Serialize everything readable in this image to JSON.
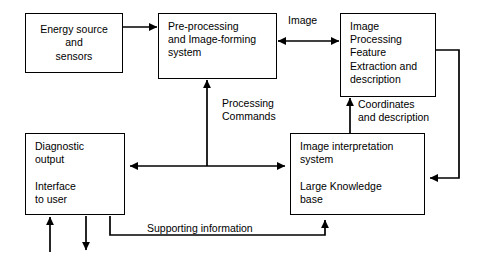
{
  "diagram": {
    "stroke_color": "#000000",
    "background_color": "#ffffff",
    "nodes": [
      {
        "id": "energy-source",
        "label": "Energy source\nand\nsensors",
        "x": 25,
        "y": 13,
        "w": 98,
        "h": 60,
        "align": "center"
      },
      {
        "id": "pre-processing",
        "label": "Pre-processing\nand Image-forming\nsystem",
        "x": 158,
        "y": 13,
        "w": 119,
        "h": 66,
        "align": "left"
      },
      {
        "id": "image-processing",
        "label": "Image\nProcessing\nFeature\nExtraction and\ndescription",
        "x": 340,
        "y": 13,
        "w": 96,
        "h": 84,
        "align": "left"
      },
      {
        "id": "diagnostic-output",
        "label": "Diagnostic\noutput\n\nInterface\nto user",
        "x": 25,
        "y": 133,
        "w": 100,
        "h": 82,
        "align": "left"
      },
      {
        "id": "image-interpretation",
        "label": "Image interpretation\nsystem\n\nLarge Knowledge\nbase",
        "x": 290,
        "y": 133,
        "w": 135,
        "h": 82,
        "align": "left"
      }
    ],
    "edge_labels": [
      {
        "id": "image",
        "text": "Image",
        "x": 288,
        "y": 14
      },
      {
        "id": "processing-commands",
        "text": "Processing\nCommands",
        "x": 222,
        "y": 97
      },
      {
        "id": "coordinates-and-description",
        "text": "Coordinates\nand description",
        "x": 358,
        "y": 98
      },
      {
        "id": "supporting-information",
        "text": "Supporting information",
        "x": 147,
        "y": 222
      }
    ]
  }
}
